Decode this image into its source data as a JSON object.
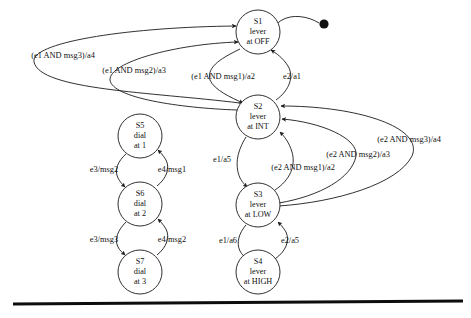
{
  "diagram": {
    "type": "state-machine",
    "colors": {
      "background": "#ffffff",
      "stroke": "#1a1a1a",
      "text": "#111111",
      "rule": "#0d0d0d"
    },
    "initial_marker": {
      "name": "initial-state-dot",
      "target": "S1",
      "cx": 324,
      "cy": 24,
      "r": 4.6
    },
    "states": [
      {
        "id": "S1",
        "lines": [
          "S1",
          "lever",
          "at OFF"
        ],
        "cx": 258,
        "cy": 32,
        "r": 22
      },
      {
        "id": "S2",
        "lines": [
          "S2",
          "lever",
          "at INT"
        ],
        "cx": 258,
        "cy": 117,
        "r": 22
      },
      {
        "id": "S3",
        "lines": [
          "S3",
          "lever",
          "at LOW"
        ],
        "cx": 258,
        "cy": 205,
        "r": 22
      },
      {
        "id": "S4",
        "lines": [
          "S4",
          "lever",
          "at HIGH"
        ],
        "cx": 258,
        "cy": 272,
        "r": 22
      },
      {
        "id": "S5",
        "lines": [
          "S5",
          "dial",
          "at 1"
        ],
        "cx": 140,
        "cy": 136,
        "r": 22
      },
      {
        "id": "S6",
        "lines": [
          "S6",
          "dial",
          "at 2"
        ],
        "cx": 140,
        "cy": 204,
        "r": 22
      },
      {
        "id": "S7",
        "lines": [
          "S7",
          "dial",
          "at 3"
        ],
        "cx": 140,
        "cy": 272,
        "r": 22
      }
    ],
    "transitions": [
      {
        "id": "t1",
        "from": "S2",
        "to": "S1",
        "label": "(e1 AND msg3)/a4",
        "lx": 63,
        "ly": 56
      },
      {
        "id": "t2",
        "from": "S2",
        "to": "S1",
        "label": "(e1 AND msg2)/a3",
        "lx": 134,
        "ly": 71
      },
      {
        "id": "t3",
        "from": "S1",
        "to": "S2",
        "label": "(e1 AND msg1)/a2",
        "lx": 223,
        "ly": 77
      },
      {
        "id": "t4",
        "from": "S2",
        "to": "S1",
        "label": "e2/a1",
        "lx": 292,
        "ly": 77
      },
      {
        "id": "t5",
        "from": "S2",
        "to": "S3",
        "label": "e1/a5",
        "lx": 222,
        "ly": 160
      },
      {
        "id": "t6",
        "from": "S3",
        "to": "S2",
        "label": "(e2 AND msg1)/a2",
        "lx": 303,
        "ly": 168
      },
      {
        "id": "t7",
        "from": "S3",
        "to": "S2",
        "label": "(e2 AND msg2)/a3",
        "lx": 358,
        "ly": 155
      },
      {
        "id": "t8",
        "from": "S3",
        "to": "S2",
        "label": "(e2 AND msg3)/a4",
        "lx": 409,
        "ly": 140
      },
      {
        "id": "t9",
        "from": "S3",
        "to": "S4",
        "label": "e1/a6",
        "lx": 228,
        "ly": 241
      },
      {
        "id": "t10",
        "from": "S4",
        "to": "S3",
        "label": "e2/a5",
        "lx": 290,
        "ly": 241
      },
      {
        "id": "t11",
        "from": "S5",
        "to": "S6",
        "label": "e3/msg2",
        "lx": 104,
        "ly": 170
      },
      {
        "id": "t12",
        "from": "S6",
        "to": "S5",
        "label": "e4/msg1",
        "lx": 172,
        "ly": 170
      },
      {
        "id": "t13",
        "from": "S6",
        "to": "S7",
        "label": "e3/msg3",
        "lx": 104,
        "ly": 240
      },
      {
        "id": "t14",
        "from": "S7",
        "to": "S6",
        "label": "e4/msg2",
        "lx": 172,
        "ly": 240
      }
    ],
    "rule": {
      "name": "bottom-rule",
      "x1": 13,
      "y1": 304,
      "x2": 463,
      "y2": 301
    }
  }
}
